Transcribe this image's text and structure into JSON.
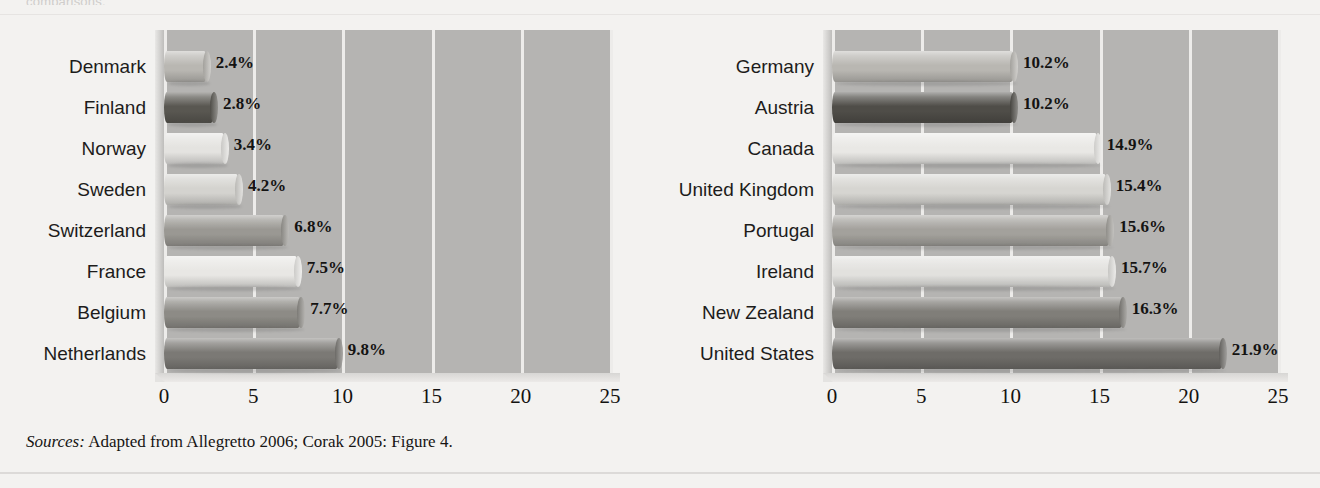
{
  "page": {
    "clipped_top_text": "comparisons.",
    "sources_prefix": "Sources:",
    "sources_text": " Adapted from Allegretto 2006; Corak 2005: Figure 4."
  },
  "axis": {
    "ticks": [
      "0",
      "5",
      "10",
      "15",
      "20",
      "25"
    ],
    "min": 0,
    "max": 25
  },
  "chart_data": [
    {
      "type": "bar",
      "orientation": "horizontal",
      "panel": "left",
      "title": "",
      "xlabel": "",
      "ylabel": "",
      "xlim": [
        0,
        25
      ],
      "grid": true,
      "legend": "none",
      "categories": [
        "Denmark",
        "Finland",
        "Norway",
        "Sweden",
        "Switzerland",
        "France",
        "Belgium",
        "Netherlands"
      ],
      "values": [
        2.4,
        2.8,
        3.4,
        4.2,
        6.8,
        7.5,
        7.7,
        9.8
      ],
      "value_labels": [
        "2.4%",
        "2.8%",
        "3.4%",
        "4.2%",
        "6.8%",
        "7.5%",
        "7.7%",
        "9.8%"
      ],
      "bar_colors": [
        "#b9b7b2",
        "#595751",
        "#e4e3e0",
        "#d4d3cf",
        "#9a9893",
        "#e8e7e4",
        "#8d8b86",
        "#7b7975"
      ]
    },
    {
      "type": "bar",
      "orientation": "horizontal",
      "panel": "right",
      "title": "",
      "xlabel": "",
      "ylabel": "",
      "xlim": [
        0,
        25
      ],
      "grid": true,
      "legend": "none",
      "categories": [
        "Germany",
        "Austria",
        "Canada",
        "United Kingdom",
        "Portugal",
        "Ireland",
        "New Zealand",
        "United States"
      ],
      "values": [
        10.2,
        10.2,
        14.9,
        15.4,
        15.6,
        15.7,
        16.3,
        21.9
      ],
      "value_labels": [
        "10.2%",
        "10.2%",
        "14.9%",
        "15.4%",
        "15.6%",
        "15.7%",
        "16.3%",
        "21.9%"
      ],
      "bar_colors": [
        "#b9b7b2",
        "#4f4d48",
        "#e9e8e5",
        "#d6d5d1",
        "#a3a19c",
        "#e2e1de",
        "#807e79",
        "#6e6c68"
      ]
    }
  ],
  "colors": {
    "page_background": "#f3f2f0",
    "plot_background": "#b5b4b2",
    "gridline": "#edecea",
    "text": "#141312"
  }
}
